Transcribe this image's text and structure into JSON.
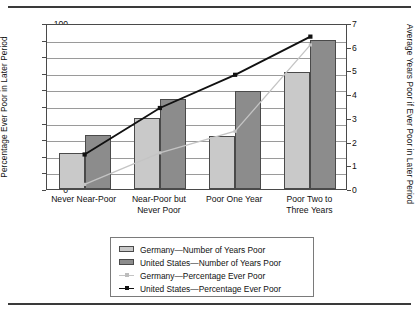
{
  "chart_data": {
    "type": "bar",
    "title": "",
    "subtitle": "",
    "categories": [
      "Never Near-Poor",
      "Near-Poor but Never Poor",
      "Poor One Year",
      "Poor Two to Three Years"
    ],
    "category_lines": [
      [
        "Never Near-Poor"
      ],
      [
        "Near-Poor but",
        "Never Poor"
      ],
      [
        "Poor One Year"
      ],
      [
        "Poor Two to",
        "Three Years"
      ]
    ],
    "xlabel": "",
    "ylabel": "Percentage Ever Poor in Later Period",
    "y2label": "Average Years Poor if Ever Poor in Later Period",
    "ylim": [
      0,
      100
    ],
    "y2lim": [
      0,
      7
    ],
    "yticks": [
      0,
      10,
      20,
      30,
      40,
      50,
      60,
      70,
      80,
      90,
      100
    ],
    "y2ticks": [
      0,
      1,
      2,
      3,
      4,
      5,
      6,
      7
    ],
    "grid": true,
    "legend_position": "bottom",
    "series": [
      {
        "name": "Germany—Number of Years Poor",
        "kind": "bar",
        "axis": "right",
        "color": "#c9c9c9",
        "values": [
          1.5,
          3.0,
          2.25,
          4.9
        ],
        "values_left_scale": [
          21.5,
          43.0,
          32.0,
          70.5
        ]
      },
      {
        "name": "United States—Number of Years Poor",
        "kind": "bar",
        "axis": "right",
        "color": "#8c8c8c",
        "values": [
          2.3,
          3.8,
          4.15,
          6.25
        ],
        "values_left_scale": [
          32.5,
          54.0,
          59.0,
          89.5
        ]
      },
      {
        "name": "Germany—Percentage Ever Poor",
        "kind": "line",
        "axis": "left",
        "color": "#c4c4c4",
        "values": [
          4,
          23,
          36,
          88
        ]
      },
      {
        "name": "United States—Percentage Ever Poor",
        "kind": "line",
        "axis": "left",
        "color": "#111111",
        "values": [
          22,
          50,
          70,
          93
        ]
      }
    ],
    "legend_entries": [
      "Germany—Number of Years Poor",
      "United States—Number of Years Poor",
      "Germany—Percentage Ever Poor",
      "United States—Percentage Ever Poor"
    ]
  }
}
